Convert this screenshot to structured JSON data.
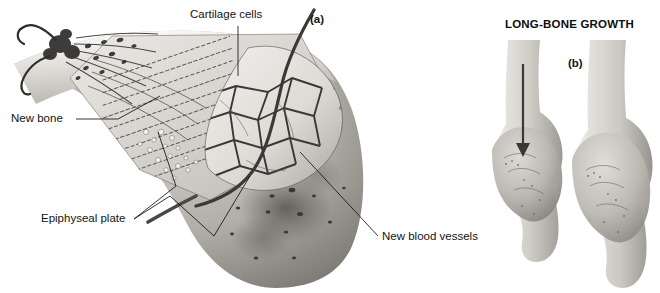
{
  "figure": {
    "title": "LONG-BONE GROWTH",
    "kind": "anatomical-illustration",
    "style": "grayscale",
    "background_color": "#ffffff"
  },
  "panels": [
    {
      "id": "a",
      "tag": "(a)",
      "description": "Cutaway of the epiphyseal plate of a growing long bone showing cartilage cell columns, new bone, and the vascular network of the epiphysis.",
      "labels": [
        {
          "name": "cartilage-cells",
          "text": "Cartilage cells"
        },
        {
          "name": "new-bone",
          "text": "New bone"
        },
        {
          "name": "epiphyseal-plate",
          "text": "Epiphyseal plate"
        },
        {
          "name": "new-blood-vessels",
          "text": "New blood vessels"
        }
      ]
    },
    {
      "id": "b",
      "tag": "(b)",
      "description": "Two whole distal bone ends compared; an arrow on the left bone indicates the direction of lengthwise growth.",
      "items": [
        {
          "name": "bone-young",
          "annotation": "growth-direction-arrow"
        },
        {
          "name": "bone-older",
          "annotation": ""
        }
      ]
    }
  ],
  "colors": {
    "ink": "#131313",
    "bone_light": "#e8e6e2",
    "bone_mid": "#bdbab4",
    "bone_dark": "#8e8b86",
    "bone_shadow": "#5f5d59",
    "vessel": "#3b3936"
  }
}
